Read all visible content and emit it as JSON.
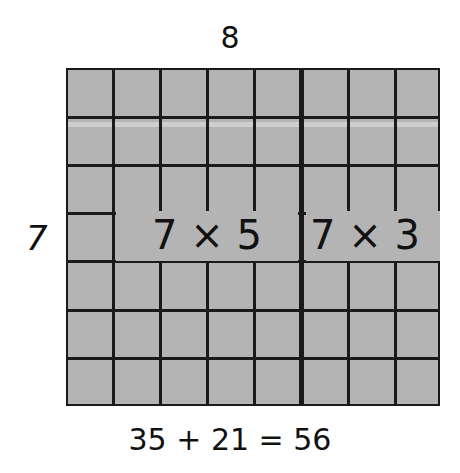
{
  "diagram": {
    "type": "area-model-multiplication",
    "top_label": "8",
    "side_label": "7",
    "grid": {
      "rows": 7,
      "columns": 8,
      "split_after_column": 5,
      "fill_color": "#b4b4b4",
      "line_color": "#1a1a1a"
    },
    "parts": [
      {
        "label": "7 × 5",
        "rows": 7,
        "columns": 5,
        "product": 35
      },
      {
        "label": "7 × 3",
        "rows": 7,
        "columns": 3,
        "product": 21
      }
    ],
    "equation": "35 + 21 = 56"
  }
}
